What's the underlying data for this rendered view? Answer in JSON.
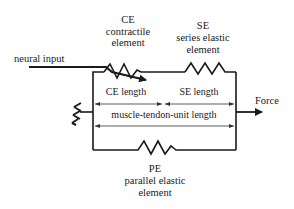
{
  "diagram": {
    "type": "Hill-type muscle model",
    "elements": {
      "ce": {
        "abbr": "CE",
        "line1": "contractile",
        "line2": "element"
      },
      "se": {
        "abbr": "SE",
        "line1": "series elastic",
        "line2": "element"
      },
      "pe": {
        "abbr": "PE",
        "line1": "parallel elastic",
        "line2": "element"
      }
    },
    "labels": {
      "neural_input": "neural input",
      "force": "Force",
      "ce_length": "CE length",
      "se_length": "SE length",
      "mtu_length": "muscle-tendon-unit length"
    },
    "colors": {
      "line": "#1a1a1a",
      "background": "#ffffff"
    }
  }
}
